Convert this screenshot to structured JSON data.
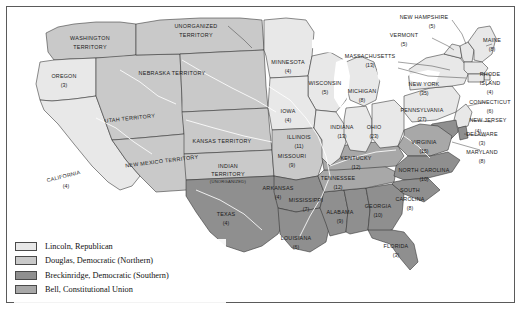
{
  "figure": {
    "background": "#ffffff",
    "frame_color": "#5a5a5a"
  },
  "legend": {
    "items": [
      {
        "label": "Lincoln, Republican",
        "color": "#e8e8e8",
        "candidate": "Lincoln",
        "party": "Republican"
      },
      {
        "label": "Douglas, Democratic (Northern)",
        "color": "#c9c9c9",
        "candidate": "Douglas",
        "party": "Democratic (Northern)"
      },
      {
        "label": "Breckinridge, Democratic (Southern)",
        "color": "#8f8f8f",
        "candidate": "Breckinridge",
        "party": "Democratic (Southern)"
      },
      {
        "label": "Bell, Constitutional Union",
        "color": "#a8a8a8",
        "candidate": "Bell",
        "party": "Constitutional Union"
      }
    ]
  },
  "map": {
    "states": [
      {
        "name": "OREGON",
        "votes": "(3)",
        "fill": "#e8e8e8"
      },
      {
        "name": "CALIFORNIA",
        "votes": "(4)",
        "fill": "#e8e8e8"
      },
      {
        "name": "MINNESOTA",
        "votes": "(4)",
        "fill": "#e8e8e8"
      },
      {
        "name": "WISCONSIN",
        "votes": "(5)",
        "fill": "#e8e8e8"
      },
      {
        "name": "IOWA",
        "votes": "(4)",
        "fill": "#e8e8e8"
      },
      {
        "name": "MICHIGAN",
        "votes": "(8)",
        "fill": "#e8e8e8"
      },
      {
        "name": "ILLINOIS",
        "votes": "(11)",
        "fill": "#e8e8e8"
      },
      {
        "name": "INDIANA",
        "votes": "(13)",
        "fill": "#e8e8e8"
      },
      {
        "name": "OHIO",
        "votes": "(23)",
        "fill": "#e8e8e8"
      },
      {
        "name": "PENNSYLVANIA",
        "votes": "(27)",
        "fill": "#e8e8e8"
      },
      {
        "name": "NEW YORK",
        "votes": "(35)",
        "fill": "#e8e8e8"
      },
      {
        "name": "NEW HAMPSHIRE",
        "votes": "(5)",
        "fill": "#e8e8e8"
      },
      {
        "name": "VERMONT",
        "votes": "(5)",
        "fill": "#e8e8e8"
      },
      {
        "name": "MAINE",
        "votes": "(8)",
        "fill": "#e8e8e8"
      },
      {
        "name": "MASSACHUSETTS",
        "votes": "(13)",
        "fill": "#e8e8e8"
      },
      {
        "name": "RHODE ISLAND",
        "votes": "(4)",
        "fill": "#e8e8e8"
      },
      {
        "name": "CONNECTICUT",
        "votes": "(6)",
        "fill": "#e8e8e8"
      },
      {
        "name": "NEW JERSEY",
        "votes": "(4)",
        "fill": "#e8e8e8"
      },
      {
        "name": "MISSOURI",
        "votes": "(9)",
        "fill": "#c9c9c9"
      },
      {
        "name": "VIRGINIA",
        "votes": "(15)",
        "fill": "#a8a8a8"
      },
      {
        "name": "KENTUCKY",
        "votes": "(12)",
        "fill": "#a8a8a8"
      },
      {
        "name": "TENNESSEE",
        "votes": "(12)",
        "fill": "#a8a8a8"
      },
      {
        "name": "NORTH CAROLINA",
        "votes": "(10)",
        "fill": "#8f8f8f"
      },
      {
        "name": "SOUTH CAROLINA",
        "votes": "(8)",
        "fill": "#8f8f8f"
      },
      {
        "name": "GEORGIA",
        "votes": "(10)",
        "fill": "#8f8f8f"
      },
      {
        "name": "FLORIDA",
        "votes": "(3)",
        "fill": "#8f8f8f"
      },
      {
        "name": "ALABAMA",
        "votes": "(9)",
        "fill": "#8f8f8f"
      },
      {
        "name": "MISSISSIPPI",
        "votes": "(7)",
        "fill": "#8f8f8f"
      },
      {
        "name": "LOUISIANA",
        "votes": "(6)",
        "fill": "#8f8f8f"
      },
      {
        "name": "ARKANSAS",
        "votes": "(4)",
        "fill": "#8f8f8f"
      },
      {
        "name": "TEXAS",
        "votes": "(4)",
        "fill": "#8f8f8f"
      },
      {
        "name": "DELAWARE",
        "votes": "(3)",
        "fill": "#8f8f8f"
      },
      {
        "name": "MARYLAND",
        "votes": "(8)",
        "fill": "#8f8f8f"
      }
    ],
    "territories": [
      {
        "name": "WASHINGTON TERRITORY",
        "sub": "",
        "fill": "#c9c9c9"
      },
      {
        "name": "UNORGANIZED TERRITORY",
        "sub": "",
        "fill": "#c9c9c9"
      },
      {
        "name": "NEBRASKA TERRITORY",
        "sub": "",
        "fill": "#c9c9c9"
      },
      {
        "name": "UTAH TERRITORY",
        "sub": "",
        "fill": "#c9c9c9"
      },
      {
        "name": "NEW MEXICO TERRITORY",
        "sub": "",
        "fill": "#c9c9c9"
      },
      {
        "name": "KANSAS TERRITORY",
        "sub": "",
        "fill": "#c9c9c9"
      },
      {
        "name": "INDIAN TERRITORY",
        "sub": "(UNORGANIZED)",
        "fill": "#c9c9c9"
      }
    ],
    "labels": {
      "washington_t_1": "WASHINGTON",
      "washington_t_2": "TERRITORY",
      "unorganized_t_1": "UNORGANIZED",
      "unorganized_t_2": "TERRITORY",
      "nebraska_t": "NEBRASKA TERRITORY",
      "utah_t": "UTAH TERRITORY",
      "newmexico_t": "NEW MEXICO TERRITORY",
      "kansas_t": "KANSAS TERRITORY",
      "indian_t_1": "INDIAN",
      "indian_t_2": "TERRITORY",
      "indian_t_3": "(UNORGANIZED)",
      "north_carolina_1": "NORTH CAROLINA",
      "south_carolina_1": "SOUTH",
      "south_carolina_2": "CAROLINA",
      "rhode_island_1": "RHODE",
      "rhode_island_2": "ISLAND",
      "new_hampshire": "NEW HAMPSHIRE",
      "massachusetts": "MASSACHUSETTS"
    }
  }
}
